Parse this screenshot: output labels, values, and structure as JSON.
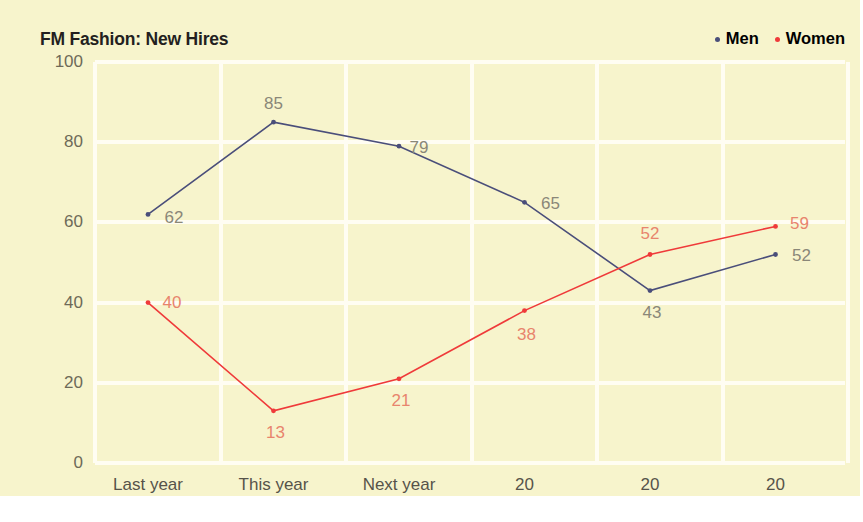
{
  "chart_data": {
    "type": "line",
    "title": "FM Fashion: New Hires",
    "xlabel": "",
    "ylabel": "",
    "categories": [
      "Last year",
      "This year",
      "Next year",
      "20",
      "20",
      "20"
    ],
    "series": [
      {
        "name": "Men",
        "color": "#4a4e7a",
        "values": [
          62,
          85,
          79,
          65,
          43,
          52
        ]
      },
      {
        "name": "Women",
        "color": "#ef3a3a",
        "values": [
          40,
          13,
          21,
          38,
          52,
          59
        ]
      }
    ],
    "yticks": [
      0,
      20,
      40,
      60,
      80,
      100
    ],
    "ylim": [
      0,
      100
    ],
    "grid": true,
    "legend_position": "top-right",
    "background_color": "#f7f4cc",
    "gridline_color": "#fffdf2",
    "men_label_color": "#8a8778",
    "women_label_color": "#e8846d",
    "axis_text_color": "#56534a"
  },
  "legend": {
    "items": [
      {
        "label": "Men",
        "dot": "legend-dot-men"
      },
      {
        "label": "Women",
        "dot": "legend-dot-women"
      }
    ]
  }
}
